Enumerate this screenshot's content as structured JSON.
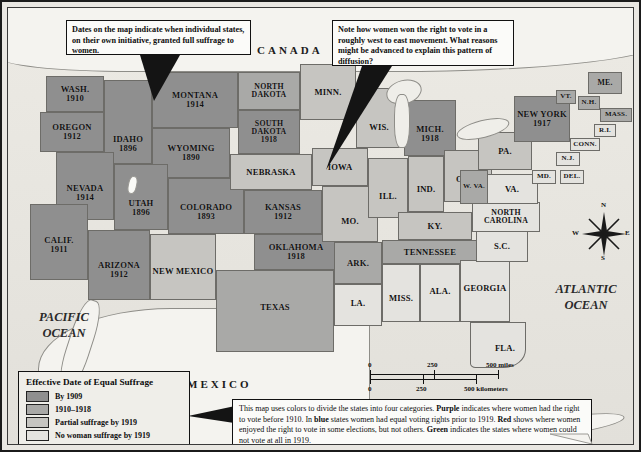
{
  "map": {
    "countries": [
      {
        "name": "CANADA"
      },
      {
        "name": "MEXICO"
      }
    ],
    "oceans": [
      {
        "name": "PACIFIC OCEAN"
      },
      {
        "name": "ATLANTIC OCEAN"
      }
    ],
    "attribution": "(after Opdycke)",
    "compass": {
      "n": "N",
      "e": "E",
      "s": "S",
      "w": "W"
    },
    "states": [
      {
        "name": "WASH.",
        "year": "1910",
        "category": "by1909"
      },
      {
        "name": "OREGON",
        "year": "1912",
        "category": "by1909"
      },
      {
        "name": "IDAHO",
        "year": "1896",
        "category": "by1909"
      },
      {
        "name": "MONTANA",
        "year": "1914",
        "category": "by1909"
      },
      {
        "name": "WYOMING",
        "year": "1890",
        "category": "by1909"
      },
      {
        "name": "NEVADA",
        "year": "1914",
        "category": "by1909"
      },
      {
        "name": "UTAH",
        "year": "1896",
        "category": "by1909"
      },
      {
        "name": "COLORADO",
        "year": "1893",
        "category": "by1909"
      },
      {
        "name": "CALIF.",
        "year": "1911",
        "category": "by1909"
      },
      {
        "name": "ARIZONA",
        "year": "1912",
        "category": "by1909"
      },
      {
        "name": "NEW MEXICO",
        "year": "",
        "category": "partial"
      },
      {
        "name": "NORTH DAKOTA",
        "year": "",
        "category": "1910-1918"
      },
      {
        "name": "SOUTH DAKOTA",
        "year": "1918",
        "category": "by1909"
      },
      {
        "name": "NEBRASKA",
        "year": "",
        "category": "partial"
      },
      {
        "name": "KANSAS",
        "year": "1912",
        "category": "by1909"
      },
      {
        "name": "OKLAHOMA",
        "year": "1918",
        "category": "by1909"
      },
      {
        "name": "TEXAS",
        "year": "",
        "category": "1910-1918"
      },
      {
        "name": "MINN.",
        "year": "",
        "category": "partial"
      },
      {
        "name": "IOWA",
        "year": "",
        "category": "partial"
      },
      {
        "name": "MO.",
        "year": "",
        "category": "partial"
      },
      {
        "name": "ARK.",
        "year": "",
        "category": "1910-1918"
      },
      {
        "name": "LA.",
        "year": "",
        "category": "none"
      },
      {
        "name": "WIS.",
        "year": "",
        "category": "partial"
      },
      {
        "name": "ILL.",
        "year": "",
        "category": "partial"
      },
      {
        "name": "MICH.",
        "year": "1918",
        "category": "by1909"
      },
      {
        "name": "IND.",
        "year": "",
        "category": "partial"
      },
      {
        "name": "OHIO",
        "year": "",
        "category": "partial"
      },
      {
        "name": "KY.",
        "year": "",
        "category": "partial"
      },
      {
        "name": "TENNESSEE",
        "year": "",
        "category": "1910-1918"
      },
      {
        "name": "MISS.",
        "year": "",
        "category": "none"
      },
      {
        "name": "ALA.",
        "year": "",
        "category": "none"
      },
      {
        "name": "GEORGIA",
        "year": "",
        "category": "none"
      },
      {
        "name": "FLA.",
        "year": "",
        "category": "none"
      },
      {
        "name": "S.C.",
        "year": "",
        "category": "none"
      },
      {
        "name": "NORTH CAROLINA",
        "year": "",
        "category": "none"
      },
      {
        "name": "VA.",
        "year": "",
        "category": "none"
      },
      {
        "name": "W. VA.",
        "year": "",
        "category": "1910-1918"
      },
      {
        "name": "PA.",
        "year": "",
        "category": "partial"
      },
      {
        "name": "MD.",
        "year": "",
        "category": "none"
      },
      {
        "name": "DEL.",
        "year": "",
        "category": "none"
      },
      {
        "name": "N.J.",
        "year": "",
        "category": "none"
      },
      {
        "name": "NEW YORK",
        "year": "1917",
        "category": "by1909"
      },
      {
        "name": "CONN.",
        "year": "",
        "category": "none"
      },
      {
        "name": "R.I.",
        "year": "",
        "category": "none"
      },
      {
        "name": "MASS.",
        "year": "",
        "category": "1910-1918"
      },
      {
        "name": "VT.",
        "year": "",
        "category": "1910-1918"
      },
      {
        "name": "N.H.",
        "year": "",
        "category": "1910-1918"
      },
      {
        "name": "ME.",
        "year": "",
        "category": "1910-1918"
      }
    ]
  },
  "callouts": [
    {
      "id": "dates-callout",
      "text": "Dates on the map indicate when individual states, on their own initiative, granted full suffrage to women."
    },
    {
      "id": "diffusion-callout",
      "text": "Note how women won the right to vote in a roughly west to east movement. What reasons might be advanced to explain this pattern of diffusion?"
    }
  ],
  "legend": {
    "title": "Effective Date of Equal Suffrage",
    "items": [
      {
        "label": "By 1909",
        "color": "#8f8f8f",
        "category": "by1909"
      },
      {
        "label": "1910–1918",
        "color": "#a9a9a7",
        "category": "1910-1918"
      },
      {
        "label": "Partial suffrage by 1919",
        "color": "#c6c5c1",
        "category": "partial"
      },
      {
        "label": "No woman suffrage by 1919",
        "color": "#e4e3df",
        "category": "none"
      }
    ]
  },
  "scale": {
    "miles": {
      "ticks": [
        "0",
        "250",
        "500"
      ],
      "unit": "miles"
    },
    "kilometers": {
      "ticks": [
        "0",
        "250",
        "500"
      ],
      "unit": "kilometers"
    }
  },
  "caption": {
    "line1_a": "This map uses colors to divide the states into four categories. ",
    "purple": "Purple",
    "line1_b": " indicates where women had the right to vote before 1910. In ",
    "blue": "blue",
    "line2_b": " states women had equal voting rights prior to 1919. ",
    "red": "Red",
    "line3_b": " shows where women enjoyed the right to vote in some elections, but not others.  ",
    "green": "Green",
    "line4_b": " indicates the states where women could not vote at all in 1919."
  }
}
